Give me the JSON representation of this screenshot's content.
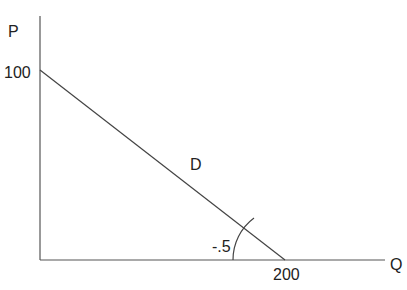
{
  "diagram": {
    "type": "demand-curve",
    "y_axis_label": "P",
    "x_axis_label": "Q",
    "y_intercept_label": "100",
    "x_intercept_label": "200",
    "curve_label": "D",
    "slope_label": "-.5",
    "y_intercept": 100,
    "x_intercept": 200
  }
}
